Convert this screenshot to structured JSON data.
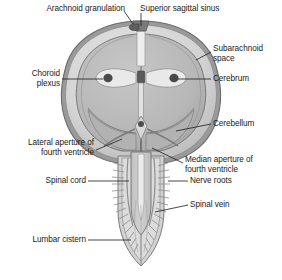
{
  "figure": {
    "colors": {
      "background": "#ffffff",
      "dura_outer": "#8e8e8e",
      "subarachnoid_space": "#d6d6d6",
      "brain_tissue": "#b9b9b9",
      "brain_outline": "#6e6e6e",
      "ventricle_fill": "#efefef",
      "choroid_plexus": "#4a4a4a",
      "spinal_cord_fill": "#c6c6c6",
      "nerve_root": "#8a8a8a",
      "leader_line": "#1a1a1a",
      "text": "#1a1a1a"
    }
  },
  "labels": [
    {
      "id": "arachnoid-granulation",
      "text": "Arachnoid granulation",
      "side": "left",
      "x": 33,
      "y": 6,
      "structure": "arachnoid granulation projecting into the superior sagittal sinus"
    },
    {
      "id": "superior-sagittal-sinus",
      "text": "Superior sagittal sinus",
      "side": "right",
      "x": 140,
      "y": 6,
      "structure": "superior sagittal sinus at the vertex of the skull"
    },
    {
      "id": "subarachnoid-space",
      "text": "Subarachnoid\nspace",
      "side": "right",
      "x": 213,
      "y": 46,
      "structure": "cerebrospinal fluid filled subarachnoid space"
    },
    {
      "id": "cerebrum",
      "text": "Cerebrum",
      "side": "right",
      "x": 213,
      "y": 76,
      "structure": "cerebral hemispheres"
    },
    {
      "id": "choroid-plexus",
      "text": "Choroid\nplexus",
      "side": "left",
      "x": 24,
      "y": 71,
      "structure": "choroid plexus within the lateral ventricles"
    },
    {
      "id": "cerebellum",
      "text": "Cerebellum",
      "side": "right",
      "x": 213,
      "y": 121,
      "structure": "cerebellum"
    },
    {
      "id": "lateral-aperture-of-fourth-ventricle",
      "text": "Lateral aperture of\nfourth ventricle",
      "side": "left",
      "x": 8,
      "y": 140,
      "structure": "lateral aperture (foramen of Luschka) of the fourth ventricle"
    },
    {
      "id": "median-aperture-of-fourth-ventricle",
      "text": "Median aperture of\nfourth ventricle",
      "side": "right",
      "x": 185,
      "y": 157,
      "structure": "median aperture (foramen of Magendie) of the fourth ventricle"
    },
    {
      "id": "spinal-cord",
      "text": "Spinal cord",
      "side": "left",
      "x": 38,
      "y": 178,
      "structure": "spinal cord"
    },
    {
      "id": "nerve-roots",
      "text": "Nerve roots",
      "side": "right",
      "x": 190,
      "y": 178,
      "structure": "spinal nerve roots"
    },
    {
      "id": "spinal-vein",
      "text": "Spinal vein",
      "side": "right",
      "x": 190,
      "y": 202,
      "structure": "spinal vein running along the cord"
    },
    {
      "id": "lumbar-cistern",
      "text": "Lumbar cistern",
      "side": "left",
      "x": 22,
      "y": 237,
      "structure": "lumbar cistern containing the cauda equina"
    }
  ]
}
